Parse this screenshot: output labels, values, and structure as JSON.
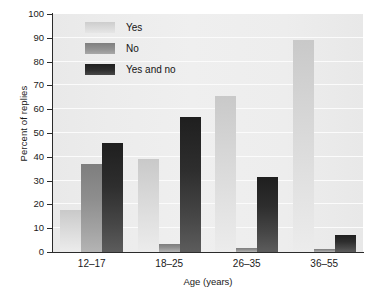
{
  "chart_data": {
    "type": "bar",
    "title": "",
    "xlabel": "Age (years)",
    "ylabel": "Percent of replies",
    "categories": [
      "12–17",
      "18–25",
      "26–35",
      "36–55"
    ],
    "series": [
      {
        "name": "Yes",
        "values": [
          17.5,
          39,
          65.5,
          89
        ],
        "color": "#d8d8d8"
      },
      {
        "name": "No",
        "values": [
          37,
          3.5,
          1.5,
          1.2
        ],
        "color": "#909090"
      },
      {
        "name": "Yes and no",
        "values": [
          45.8,
          56.8,
          31.5,
          7.3
        ],
        "color": "#2a2a2a"
      }
    ],
    "ylim": [
      0,
      100
    ],
    "ytick_labels": [
      "0",
      "10",
      "20",
      "30",
      "40",
      "50",
      "60",
      "70",
      "80",
      "90",
      "100"
    ],
    "ytick_values": [
      0,
      10,
      20,
      30,
      40,
      50,
      60,
      70,
      80,
      90,
      100
    ],
    "grid": true,
    "grid_color": "#fbfbfb",
    "plot_background": "#ececec",
    "legend_position": "top-left-inside"
  }
}
